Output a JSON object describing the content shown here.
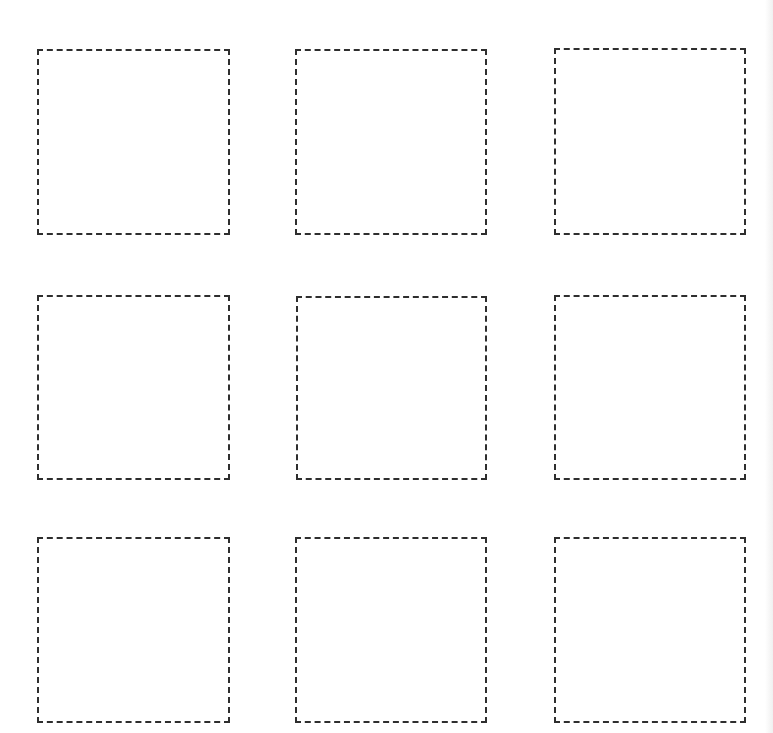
{
  "page": {
    "type": "blank worksheet",
    "background": "#ffffff",
    "stroke_color": "#2e2e2e",
    "grid": {
      "rows": 3,
      "columns": 3
    }
  },
  "boxes": [
    {
      "row": 1,
      "col": 1,
      "x": 37,
      "y": 49,
      "w": 193,
      "h": 186
    },
    {
      "row": 1,
      "col": 2,
      "x": 295,
      "y": 49,
      "w": 192,
      "h": 186
    },
    {
      "row": 1,
      "col": 3,
      "x": 554,
      "y": 48,
      "w": 192,
      "h": 187
    },
    {
      "row": 2,
      "col": 1,
      "x": 37,
      "y": 295,
      "w": 193,
      "h": 185
    },
    {
      "row": 2,
      "col": 2,
      "x": 296,
      "y": 296,
      "w": 191,
      "h": 184
    },
    {
      "row": 2,
      "col": 3,
      "x": 554,
      "y": 295,
      "w": 192,
      "h": 185
    },
    {
      "row": 3,
      "col": 1,
      "x": 37,
      "y": 537,
      "w": 193,
      "h": 186
    },
    {
      "row": 3,
      "col": 2,
      "x": 295,
      "y": 537,
      "w": 192,
      "h": 186
    },
    {
      "row": 3,
      "col": 3,
      "x": 554,
      "y": 537,
      "w": 192,
      "h": 186
    }
  ]
}
